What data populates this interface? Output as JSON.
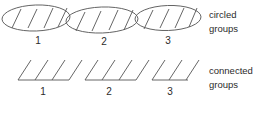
{
  "figure": {
    "background_color": "#ffffff",
    "stroke_color": "#4a4a4a",
    "text_color": "#2b2b2b"
  },
  "rows": [
    {
      "id": "circled-groups-row",
      "label_line1": "circled",
      "label_line2": "groups",
      "style": "circled",
      "groups": [
        {
          "number": "1",
          "marks": 4
        },
        {
          "number": "2",
          "marks": 4
        },
        {
          "number": "3",
          "marks": 4
        }
      ]
    },
    {
      "id": "connected-groups-row",
      "label_line1": "connected",
      "label_line2": "groups",
      "style": "connected",
      "groups": [
        {
          "number": "1",
          "marks": 4
        },
        {
          "number": "2",
          "marks": 4
        },
        {
          "number": "3",
          "marks": 4
        }
      ]
    }
  ]
}
